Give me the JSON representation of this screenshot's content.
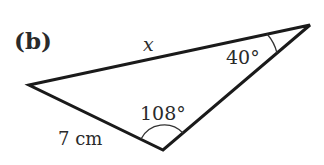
{
  "figure": {
    "part_label": "(b)",
    "side_label_x": "x",
    "side_label_7cm": "7 cm",
    "angle_top_right": "40°",
    "angle_bottom": "108°"
  },
  "geometry": {
    "vertices": {
      "left": [
        29,
        85
      ],
      "top_right": [
        310,
        25
      ],
      "bottom": [
        163,
        150
      ]
    },
    "stroke_color": "#1a1a1a"
  }
}
